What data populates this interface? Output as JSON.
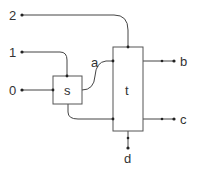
{
  "diagram": {
    "inputs": [
      {
        "id": "in2",
        "label": "2"
      },
      {
        "id": "in1",
        "label": "1"
      },
      {
        "id": "in0",
        "label": "0"
      }
    ],
    "nodes": [
      {
        "id": "s",
        "label": "s"
      },
      {
        "id": "t",
        "label": "t"
      }
    ],
    "wire_labels": [
      {
        "id": "a",
        "label": "a"
      }
    ],
    "outputs": [
      {
        "id": "b",
        "label": "b"
      },
      {
        "id": "c",
        "label": "c"
      },
      {
        "id": "d",
        "label": "d"
      }
    ],
    "colors": {
      "stroke": "#444444",
      "text": "#333333",
      "background": "#ffffff"
    }
  }
}
